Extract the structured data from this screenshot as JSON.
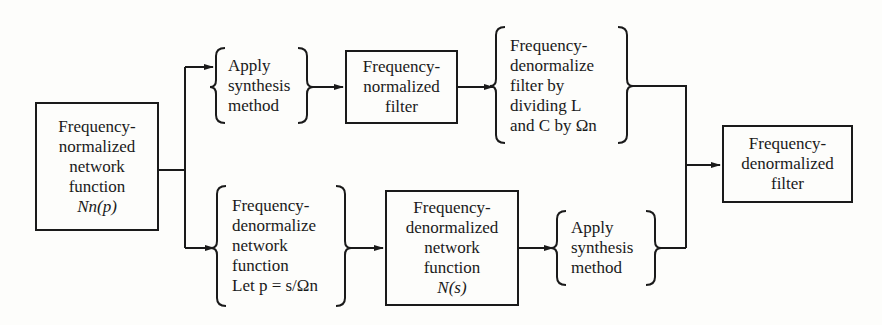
{
  "diagram": {
    "type": "flowchart",
    "nodes": {
      "start": {
        "shape": "box",
        "lines": [
          "Frequency-",
          "normalized",
          "network",
          "function",
          "Nn(p)"
        ]
      },
      "top_step1": {
        "shape": "brace",
        "lines": [
          "Apply",
          "synthesis",
          "method"
        ]
      },
      "top_box": {
        "shape": "box",
        "lines": [
          "Frequency-",
          "normalized",
          "filter"
        ]
      },
      "top_step2": {
        "shape": "brace",
        "lines": [
          "Frequency-",
          "denormalize",
          "filter by",
          "dividing L",
          "and C by Ωn"
        ]
      },
      "bottom_step1": {
        "shape": "brace",
        "lines": [
          "Frequency-",
          "denormalize",
          "network",
          "function",
          "Let p = s/Ωn"
        ]
      },
      "bottom_box": {
        "shape": "box",
        "lines": [
          "Frequency-",
          "denormalized",
          "network",
          "function",
          "N(s)"
        ]
      },
      "bottom_step2": {
        "shape": "brace",
        "lines": [
          "Apply",
          "synthesis",
          "method"
        ]
      },
      "end": {
        "shape": "box",
        "lines": [
          "Frequency-",
          "denormalized",
          "filter"
        ]
      }
    },
    "edges": [
      [
        "start",
        "top_step1"
      ],
      [
        "top_step1",
        "top_box"
      ],
      [
        "top_box",
        "top_step2"
      ],
      [
        "top_step2",
        "end"
      ],
      [
        "start",
        "bottom_step1"
      ],
      [
        "bottom_step1",
        "bottom_box"
      ],
      [
        "bottom_box",
        "bottom_step2"
      ],
      [
        "bottom_step2",
        "end"
      ]
    ],
    "colors": {
      "ink": "#1a1a1a",
      "paper": "#fdfdfb"
    }
  }
}
